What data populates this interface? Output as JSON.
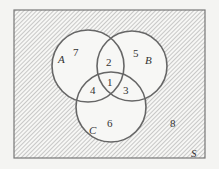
{
  "diagram": {
    "type": "venn",
    "universe_label": "S",
    "sets": [
      {
        "label": "A"
      },
      {
        "label": "B"
      },
      {
        "label": "C"
      }
    ],
    "regions": {
      "A_B_C": "1",
      "A_B_only": "2",
      "B_C_only": "3",
      "A_C_only": "4",
      "B_only": "5",
      "C_only": "6",
      "A_only": "7",
      "outside": "8"
    },
    "shaded_region": "outside all circles (hatched)",
    "colors": {
      "outline": "#666666",
      "hatch": "#9a9a9a",
      "background": "#f4f4f2"
    }
  }
}
